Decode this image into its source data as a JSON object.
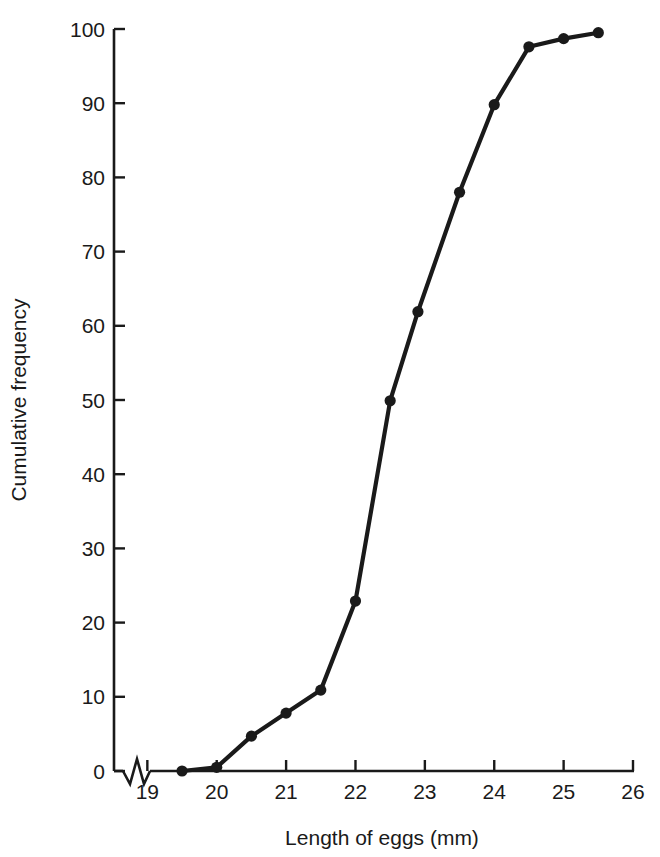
{
  "chart_data": {
    "type": "line",
    "title": "",
    "subtitle": "",
    "xlabel": "Length of eggs (mm)",
    "ylabel": "Cumulative frequency",
    "xlim": [
      18.75,
      26
    ],
    "ylim": [
      0,
      100
    ],
    "xticks": [
      19,
      20,
      21,
      22,
      23,
      24,
      25,
      26
    ],
    "yticks": [
      0,
      10,
      20,
      30,
      40,
      50,
      60,
      70,
      80,
      90,
      100
    ],
    "xtick_labels": [
      "19",
      "20",
      "21",
      "22",
      "23",
      "24",
      "25",
      "26"
    ],
    "ytick_labels": [
      "0",
      "10",
      "20",
      "30",
      "40",
      "50",
      "60",
      "70",
      "80",
      "90",
      "100"
    ],
    "grid": false,
    "legend": null,
    "axis_break": {
      "axis": "x",
      "symbol": "zigzag",
      "position_between": [
        18.8,
        19.0
      ]
    },
    "marker": "filled-circle",
    "line_color": "#1a1a1a",
    "marker_color": "#1a1a1a",
    "series": [
      {
        "name": "Cumulative frequency of egg lengths",
        "x": [
          19.5,
          20.0,
          20.5,
          21.0,
          21.5,
          22.0,
          22.5,
          22.9,
          23.5,
          24.0,
          24.5,
          25.0,
          25.5
        ],
        "y": [
          0.0,
          0.5,
          4.7,
          7.8,
          10.9,
          22.9,
          49.9,
          61.9,
          78.0,
          89.8,
          97.6,
          98.7,
          99.5
        ]
      }
    ]
  },
  "figure": {
    "background_color": "#ffffff",
    "ink_color": "#1a1a1a"
  }
}
